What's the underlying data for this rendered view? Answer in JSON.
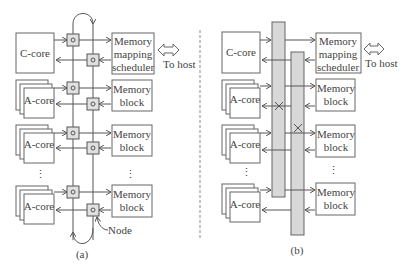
{
  "panel_a": {
    "caption": "(a)",
    "c_core": "C-core",
    "a_cores": [
      "A-core",
      "A-core",
      "A-core"
    ],
    "scheduler": [
      "Memory",
      "mapping",
      "scheduler"
    ],
    "memory_blocks": [
      [
        "Memory",
        "block"
      ],
      [
        "Memory",
        "block"
      ],
      [
        "Memory",
        "block"
      ]
    ],
    "to_host": "To host",
    "node_label": "Node"
  },
  "panel_b": {
    "caption": "(b)",
    "c_core": "C-core",
    "a_cores": [
      "A-core",
      "A-core",
      "A-core"
    ],
    "scheduler": [
      "Memory",
      "mapping",
      "scheduler"
    ],
    "memory_blocks": [
      [
        "Memory",
        "block"
      ],
      [
        "Memory",
        "block"
      ],
      [
        "Memory",
        "block"
      ]
    ],
    "to_host": "To host"
  },
  "ellipsis": "⋮"
}
